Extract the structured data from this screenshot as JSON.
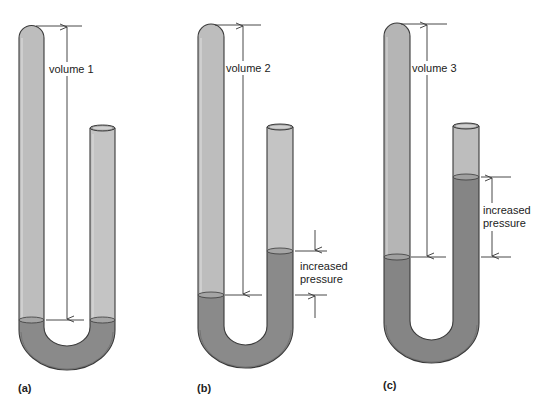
{
  "figure": {
    "colors": {
      "gas": "#bdbdbd",
      "mercury": "#8a8a8a",
      "outline": "#3a3a3a",
      "background": "#ffffff"
    },
    "panels": [
      {
        "id": "a",
        "label": "(a)",
        "volume_label": "volume 1",
        "pressure_label_line1": "",
        "pressure_label_line2": ""
      },
      {
        "id": "b",
        "label": "(b)",
        "volume_label": "volume 2",
        "pressure_label_line1": "increased",
        "pressure_label_line2": "pressure"
      },
      {
        "id": "c",
        "label": "(c)",
        "volume_label": "volume 3",
        "pressure_label_line1": "increased",
        "pressure_label_line2": "pressure"
      }
    ]
  }
}
